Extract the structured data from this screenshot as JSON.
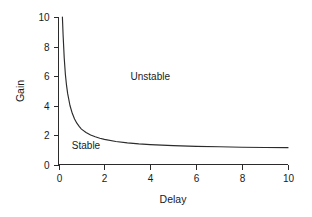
{
  "chart_data": {
    "type": "line",
    "title": "",
    "xlabel": "Delay",
    "ylabel": "Gain",
    "xlim": [
      0,
      10
    ],
    "ylim": [
      0,
      10
    ],
    "grid": false,
    "legend": "none",
    "xticks": [
      0,
      2,
      4,
      6,
      8,
      10
    ],
    "xtick_labels": [
      "0",
      "2",
      "4",
      "6",
      "8",
      "10"
    ],
    "yticks": [
      0,
      2,
      4,
      6,
      8,
      10
    ],
    "ytick_labels": [
      "0",
      "2",
      "4",
      "6",
      "8",
      "10"
    ],
    "series": [
      {
        "name": "stability boundary",
        "color": "#2b2b2b",
        "x": [
          0.17,
          0.2,
          0.25,
          0.3,
          0.35,
          0.4,
          0.5,
          0.6,
          0.7,
          0.8,
          0.9,
          1.0,
          1.2,
          1.4,
          1.6,
          1.8,
          2.0,
          2.5,
          3.0,
          3.5,
          4.0,
          5.0,
          6.0,
          7.0,
          8.0,
          9.0,
          10.0
        ],
        "y": [
          10.0,
          8.8,
          7.2,
          6.1,
          5.36,
          4.8,
          4.0,
          3.47,
          3.09,
          2.8,
          2.58,
          2.4,
          2.17,
          2.0,
          1.88,
          1.78,
          1.7,
          1.56,
          1.47,
          1.4,
          1.35,
          1.28,
          1.23,
          1.2,
          1.17,
          1.15,
          1.14
        ]
      }
    ],
    "annotations": [
      {
        "text": "Unstable",
        "x": 4.0,
        "y": 5.7
      },
      {
        "text": "Stable",
        "x": 1.2,
        "y": 1.05
      }
    ]
  },
  "axes": {
    "x_title": "Delay",
    "y_title": "Gain"
  },
  "regions": {
    "unstable_label": "Unstable",
    "stable_label": "Stable"
  },
  "colors": {
    "curve": "#2b2b2b",
    "axis": "#2b2b2b",
    "text": "#1a1a1a",
    "background": "#ffffff"
  }
}
